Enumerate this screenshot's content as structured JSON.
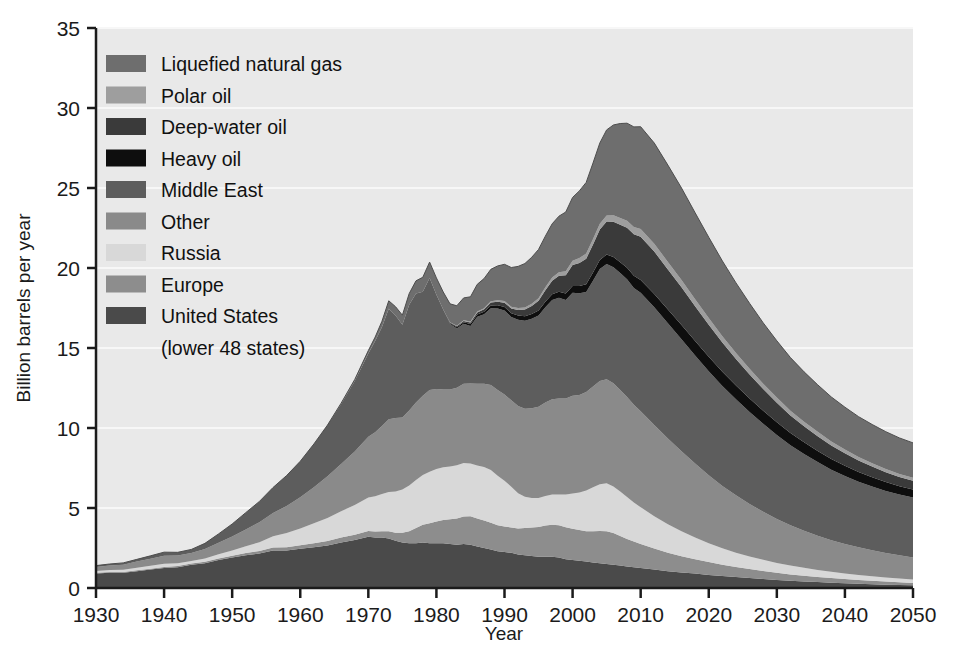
{
  "chart_data": {
    "type": "area",
    "title": "",
    "xlabel": "Year",
    "ylabel": "Billion barrels per year",
    "xlim": [
      1930,
      2050
    ],
    "ylim": [
      0,
      35
    ],
    "xticks": [
      1930,
      1940,
      1950,
      1960,
      1970,
      1980,
      1990,
      2000,
      2010,
      2020,
      2030,
      2040,
      2050
    ],
    "yticks": [
      0,
      5,
      10,
      15,
      20,
      25,
      30,
      35
    ],
    "grid": "horizontal-white",
    "legend_position": "upper-left-inside",
    "stacking": "bottom-to-top",
    "x": [
      1930,
      1932,
      1934,
      1936,
      1938,
      1940,
      1942,
      1944,
      1946,
      1948,
      1950,
      1952,
      1954,
      1956,
      1958,
      1960,
      1962,
      1964,
      1966,
      1968,
      1970,
      1971,
      1972,
      1973,
      1974,
      1975,
      1976,
      1977,
      1978,
      1979,
      1980,
      1981,
      1982,
      1983,
      1984,
      1985,
      1986,
      1987,
      1988,
      1989,
      1990,
      1991,
      1992,
      1993,
      1994,
      1995,
      1996,
      1997,
      1998,
      1999,
      2000,
      2001,
      2002,
      2003,
      2004,
      2005,
      2006,
      2007,
      2008,
      2009,
      2010,
      2012,
      2014,
      2016,
      2018,
      2020,
      2022,
      2024,
      2026,
      2028,
      2030,
      2032,
      2034,
      2036,
      2038,
      2040,
      2042,
      2044,
      2046,
      2048,
      2050
    ],
    "series": [
      {
        "name": "United  States (lower 48 states)",
        "color": "#4a4a4a",
        "legend_label": "United  States",
        "legend_label2": "(lower 48 states)",
        "values": [
          0.9,
          0.95,
          0.95,
          1.05,
          1.15,
          1.25,
          1.3,
          1.45,
          1.55,
          1.75,
          1.9,
          2.05,
          2.15,
          2.35,
          2.35,
          2.45,
          2.55,
          2.65,
          2.85,
          3.0,
          3.2,
          3.15,
          3.15,
          3.1,
          2.95,
          2.85,
          2.8,
          2.8,
          2.85,
          2.8,
          2.8,
          2.8,
          2.75,
          2.7,
          2.75,
          2.7,
          2.6,
          2.5,
          2.4,
          2.3,
          2.25,
          2.2,
          2.1,
          2.05,
          2.0,
          1.95,
          1.95,
          1.95,
          1.9,
          1.8,
          1.75,
          1.7,
          1.65,
          1.6,
          1.55,
          1.5,
          1.45,
          1.4,
          1.35,
          1.3,
          1.25,
          1.15,
          1.05,
          0.97,
          0.9,
          0.82,
          0.75,
          0.68,
          0.62,
          0.56,
          0.5,
          0.45,
          0.41,
          0.37,
          0.33,
          0.3,
          0.27,
          0.24,
          0.21,
          0.19,
          0.17
        ]
      },
      {
        "name": "Europe",
        "color": "#8d8d8d",
        "legend_label": "Europe",
        "values": [
          0.05,
          0.05,
          0.05,
          0.06,
          0.06,
          0.07,
          0.07,
          0.08,
          0.09,
          0.1,
          0.12,
          0.14,
          0.16,
          0.18,
          0.2,
          0.22,
          0.25,
          0.28,
          0.3,
          0.33,
          0.36,
          0.38,
          0.4,
          0.45,
          0.5,
          0.6,
          0.75,
          0.95,
          1.1,
          1.25,
          1.35,
          1.45,
          1.55,
          1.65,
          1.72,
          1.78,
          1.74,
          1.72,
          1.68,
          1.62,
          1.6,
          1.58,
          1.62,
          1.7,
          1.78,
          1.86,
          1.95,
          2.0,
          2.02,
          2.0,
          1.96,
          1.92,
          1.9,
          1.95,
          2.02,
          2.05,
          1.98,
          1.85,
          1.72,
          1.6,
          1.5,
          1.32,
          1.16,
          1.02,
          0.9,
          0.8,
          0.71,
          0.63,
          0.56,
          0.5,
          0.45,
          0.4,
          0.36,
          0.32,
          0.29,
          0.26,
          0.23,
          0.21,
          0.19,
          0.17,
          0.15
        ]
      },
      {
        "name": "Russia",
        "color": "#d8d8d8",
        "legend_label": "Russia",
        "values": [
          0.12,
          0.13,
          0.14,
          0.16,
          0.18,
          0.2,
          0.18,
          0.16,
          0.2,
          0.26,
          0.32,
          0.42,
          0.55,
          0.7,
          0.88,
          1.05,
          1.25,
          1.45,
          1.65,
          1.85,
          2.1,
          2.2,
          2.32,
          2.45,
          2.58,
          2.7,
          2.85,
          3.0,
          3.12,
          3.22,
          3.28,
          3.3,
          3.3,
          3.32,
          3.34,
          3.3,
          3.32,
          3.34,
          3.3,
          3.1,
          2.85,
          2.55,
          2.2,
          1.95,
          1.85,
          1.82,
          1.85,
          1.9,
          1.92,
          2.05,
          2.2,
          2.35,
          2.55,
          2.75,
          2.92,
          3.0,
          2.92,
          2.78,
          2.62,
          2.45,
          2.3,
          2.02,
          1.78,
          1.56,
          1.36,
          1.18,
          1.02,
          0.9,
          0.79,
          0.7,
          0.62,
          0.55,
          0.49,
          0.44,
          0.39,
          0.35,
          0.32,
          0.29,
          0.26,
          0.23,
          0.21
        ]
      },
      {
        "name": "Other",
        "color": "#8a8a8a",
        "legend_label": "Other",
        "values": [
          0.25,
          0.28,
          0.32,
          0.38,
          0.44,
          0.5,
          0.48,
          0.5,
          0.6,
          0.72,
          0.88,
          1.05,
          1.25,
          1.45,
          1.7,
          1.95,
          2.25,
          2.6,
          2.95,
          3.35,
          3.8,
          4.0,
          4.25,
          4.55,
          4.6,
          4.5,
          4.7,
          4.85,
          4.95,
          5.1,
          5.0,
          4.85,
          4.8,
          4.85,
          4.95,
          5.0,
          5.1,
          5.2,
          5.3,
          5.35,
          5.4,
          5.4,
          5.45,
          5.5,
          5.6,
          5.7,
          5.85,
          5.95,
          6.0,
          6.0,
          6.1,
          6.1,
          6.15,
          6.3,
          6.45,
          6.5,
          6.45,
          6.35,
          6.25,
          6.1,
          6.0,
          5.7,
          5.35,
          5.0,
          4.62,
          4.25,
          3.9,
          3.58,
          3.28,
          3.0,
          2.75,
          2.52,
          2.32,
          2.14,
          1.98,
          1.84,
          1.72,
          1.62,
          1.53,
          1.45,
          1.38
        ]
      },
      {
        "name": "Middle East",
        "color": "#5d5d5d",
        "legend_label": "Middle East",
        "values": [
          0.08,
          0.09,
          0.11,
          0.14,
          0.18,
          0.22,
          0.2,
          0.22,
          0.35,
          0.55,
          0.78,
          1.05,
          1.3,
          1.6,
          1.9,
          2.25,
          2.7,
          3.2,
          3.75,
          4.4,
          5.2,
          5.7,
          6.2,
          6.9,
          6.4,
          5.8,
          6.6,
          6.8,
          6.5,
          7.0,
          5.9,
          5.0,
          4.1,
          3.7,
          3.75,
          3.6,
          4.2,
          4.35,
          4.8,
          5.1,
          5.25,
          5.2,
          5.4,
          5.5,
          5.6,
          5.7,
          5.95,
          6.2,
          6.3,
          6.15,
          6.45,
          6.35,
          6.25,
          6.6,
          7.0,
          7.2,
          7.25,
          7.3,
          7.35,
          7.3,
          7.4,
          7.35,
          7.2,
          7.0,
          6.75,
          6.5,
          6.25,
          6.0,
          5.75,
          5.5,
          5.25,
          5.0,
          4.8,
          4.6,
          4.4,
          4.25,
          4.1,
          3.98,
          3.88,
          3.8,
          3.75
        ]
      },
      {
        "name": "Heavy oil",
        "color": "#0e0e0e",
        "legend_label": "Heavy oil",
        "values": [
          0.0,
          0.0,
          0.0,
          0.0,
          0.0,
          0.0,
          0.0,
          0.0,
          0.0,
          0.0,
          0.0,
          0.0,
          0.0,
          0.0,
          0.0,
          0.0,
          0.0,
          0.0,
          0.0,
          0.0,
          0.0,
          0.0,
          0.0,
          0.0,
          0.0,
          0.0,
          0.0,
          0.0,
          0.0,
          0.0,
          0.0,
          0.0,
          0.05,
          0.08,
          0.1,
          0.12,
          0.14,
          0.16,
          0.18,
          0.2,
          0.22,
          0.24,
          0.26,
          0.28,
          0.3,
          0.32,
          0.34,
          0.36,
          0.38,
          0.4,
          0.42,
          0.45,
          0.48,
          0.52,
          0.56,
          0.6,
          0.64,
          0.68,
          0.72,
          0.76,
          0.8,
          0.84,
          0.87,
          0.89,
          0.9,
          0.9,
          0.89,
          0.87,
          0.85,
          0.82,
          0.79,
          0.76,
          0.73,
          0.7,
          0.67,
          0.64,
          0.61,
          0.58,
          0.55,
          0.52,
          0.5
        ]
      },
      {
        "name": "Deep-water oil",
        "color": "#3a3a3a",
        "legend_label": "Deep-water oil",
        "values": [
          0.0,
          0.0,
          0.0,
          0.0,
          0.0,
          0.0,
          0.0,
          0.0,
          0.0,
          0.0,
          0.0,
          0.0,
          0.0,
          0.0,
          0.0,
          0.0,
          0.0,
          0.0,
          0.0,
          0.0,
          0.0,
          0.0,
          0.0,
          0.0,
          0.0,
          0.0,
          0.0,
          0.0,
          0.0,
          0.0,
          0.0,
          0.0,
          0.04,
          0.06,
          0.08,
          0.1,
          0.12,
          0.15,
          0.18,
          0.22,
          0.26,
          0.3,
          0.35,
          0.42,
          0.5,
          0.6,
          0.72,
          0.85,
          1.0,
          1.15,
          1.3,
          1.45,
          1.6,
          1.75,
          1.9,
          2.05,
          2.2,
          2.35,
          2.5,
          2.6,
          2.7,
          2.65,
          2.5,
          2.35,
          2.18,
          2.0,
          1.82,
          1.65,
          1.5,
          1.35,
          1.22,
          1.1,
          1.0,
          0.92,
          0.85,
          0.78,
          0.72,
          0.67,
          0.62,
          0.58,
          0.55
        ]
      },
      {
        "name": "Polar oil",
        "color": "#9e9e9e",
        "legend_label": "Polar oil",
        "values": [
          0.0,
          0.0,
          0.0,
          0.0,
          0.0,
          0.0,
          0.0,
          0.0,
          0.0,
          0.0,
          0.0,
          0.0,
          0.0,
          0.0,
          0.0,
          0.0,
          0.0,
          0.0,
          0.0,
          0.0,
          0.0,
          0.0,
          0.0,
          0.0,
          0.0,
          0.0,
          0.0,
          0.0,
          0.0,
          0.0,
          0.0,
          0.0,
          0.02,
          0.03,
          0.04,
          0.05,
          0.06,
          0.07,
          0.08,
          0.09,
          0.1,
          0.11,
          0.12,
          0.13,
          0.14,
          0.16,
          0.18,
          0.2,
          0.22,
          0.25,
          0.28,
          0.3,
          0.32,
          0.34,
          0.36,
          0.38,
          0.4,
          0.42,
          0.44,
          0.46,
          0.48,
          0.48,
          0.47,
          0.46,
          0.44,
          0.42,
          0.4,
          0.38,
          0.36,
          0.34,
          0.32,
          0.3,
          0.28,
          0.27,
          0.25,
          0.24,
          0.22,
          0.21,
          0.2,
          0.19,
          0.18
        ]
      },
      {
        "name": "Liquefied natural gas",
        "color": "#6e6e6e",
        "legend_label": "Liquefied natural gas",
        "values": [
          0.0,
          0.0,
          0.0,
          0.0,
          0.0,
          0.0,
          0.0,
          0.0,
          0.0,
          0.0,
          0.0,
          0.0,
          0.0,
          0.0,
          0.0,
          0.0,
          0.0,
          0.0,
          0.05,
          0.1,
          0.18,
          0.25,
          0.35,
          0.5,
          0.55,
          0.6,
          0.7,
          0.8,
          0.9,
          1.0,
          1.05,
          1.1,
          1.15,
          1.25,
          1.4,
          1.55,
          1.7,
          1.85,
          2.0,
          2.15,
          2.3,
          2.45,
          2.6,
          2.75,
          2.9,
          3.05,
          3.2,
          3.35,
          3.5,
          3.7,
          3.95,
          4.2,
          4.45,
          4.75,
          5.05,
          5.35,
          5.65,
          5.9,
          6.1,
          6.25,
          6.4,
          6.3,
          6.05,
          5.75,
          5.4,
          5.05,
          4.7,
          4.38,
          4.08,
          3.8,
          3.55,
          3.32,
          3.12,
          2.94,
          2.78,
          2.64,
          2.52,
          2.42,
          2.33,
          2.25,
          2.18
        ]
      }
    ]
  },
  "legend": {
    "items": [
      {
        "label": "Liquefied natural gas",
        "color": "#6e6e6e"
      },
      {
        "label": "Polar oil",
        "color": "#9e9e9e"
      },
      {
        "label": "Deep-water oil",
        "color": "#3a3a3a"
      },
      {
        "label": "Heavy oil",
        "color": "#0e0e0e"
      },
      {
        "label": "Middle East",
        "color": "#5d5d5d"
      },
      {
        "label": "Other",
        "color": "#8a8a8a"
      },
      {
        "label": "Russia",
        "color": "#d8d8d8"
      },
      {
        "label": "Europe",
        "color": "#8d8d8d"
      },
      {
        "label": "United  States",
        "color": "#4a4a4a"
      },
      {
        "label": "(lower 48 states)",
        "color": null
      }
    ]
  },
  "axes": {
    "y_title": "Billion barrels per year",
    "x_title": "Year",
    "y_ticks": [
      "0",
      "5",
      "10",
      "15",
      "20",
      "25",
      "30",
      "35"
    ],
    "x_ticks": [
      "1930",
      "1940",
      "1950",
      "1960",
      "1970",
      "1980",
      "1990",
      "2000",
      "2010",
      "2020",
      "2030",
      "2040",
      "2050"
    ]
  },
  "colors": {
    "plot_background": "#e9e9e9",
    "gridline": "#f7f7f7",
    "axis_line": "#1b1b1b",
    "page_background": "#ffffff",
    "text": "#1b1b1b"
  }
}
